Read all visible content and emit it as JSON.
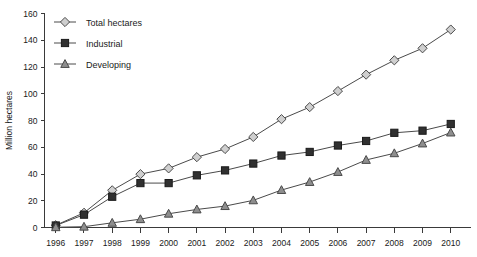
{
  "chart_data": {
    "type": "line",
    "title": "",
    "xlabel": "",
    "ylabel": "Million hectares",
    "categories": [
      "1996",
      "1997",
      "1998",
      "1999",
      "2000",
      "2001",
      "2002",
      "2003",
      "2004",
      "2005",
      "2006",
      "2007",
      "2008",
      "2009",
      "2010"
    ],
    "x": [
      1996,
      1997,
      1998,
      1999,
      2000,
      2001,
      2002,
      2003,
      2004,
      2005,
      2006,
      2007,
      2008,
      2009,
      2010
    ],
    "xlim": [
      1995.6,
      2010.7
    ],
    "ylim": [
      0,
      160
    ],
    "yticks": [
      0,
      20,
      40,
      60,
      80,
      100,
      120,
      140,
      160
    ],
    "grid": false,
    "legend_position": "top-left",
    "series": [
      {
        "name": "Total hectares",
        "marker": "diamond",
        "marker_fill": "#cfcfcf",
        "marker_stroke": "#4a4a4a",
        "line_color": "#4a4a4a",
        "values": [
          1.7,
          11.0,
          27.8,
          39.9,
          44.2,
          52.6,
          58.7,
          67.7,
          81.0,
          90.0,
          102.0,
          114.3,
          125.0,
          134.0,
          148.0
        ]
      },
      {
        "name": "Industrial",
        "marker": "square",
        "marker_fill": "#303030",
        "marker_stroke": "#1a1a1a",
        "line_color": "#4a4a4a",
        "values": [
          1.5,
          9.6,
          23.0,
          33.2,
          33.2,
          39.0,
          42.7,
          47.8,
          53.8,
          56.5,
          61.3,
          64.7,
          70.8,
          72.4,
          77.4
        ]
      },
      {
        "name": "Developing",
        "marker": "triangle",
        "marker_fill": "#8e8e8e",
        "marker_stroke": "#4a4a4a",
        "line_color": "#4a4a4a",
        "values": [
          0.2,
          0.6,
          3.5,
          6.2,
          10.3,
          13.5,
          16.0,
          20.3,
          28.0,
          34.0,
          41.5,
          50.5,
          55.5,
          62.8,
          71.0
        ]
      }
    ]
  },
  "legend": {
    "items": [
      {
        "label": "Total hectares"
      },
      {
        "label": "Industrial"
      },
      {
        "label": "Developing"
      }
    ]
  },
  "axes": {
    "y_title": "Million hectares"
  }
}
